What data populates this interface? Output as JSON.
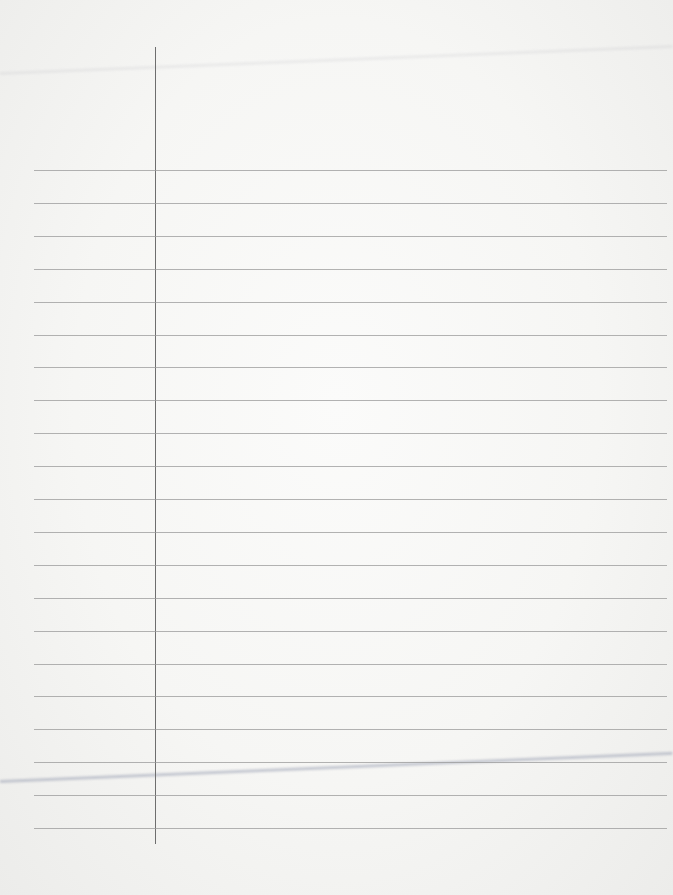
{
  "paper": {
    "type": "ruled-notebook-page",
    "margin_line": {
      "x": 155,
      "top": 47,
      "bottom": 844,
      "color": "#6e6e6e"
    },
    "rules": {
      "first_y": 170,
      "spacing": 32.9,
      "count": 21,
      "left": 34,
      "color": "#9a9a9a"
    },
    "background": "#f6f6f4"
  }
}
